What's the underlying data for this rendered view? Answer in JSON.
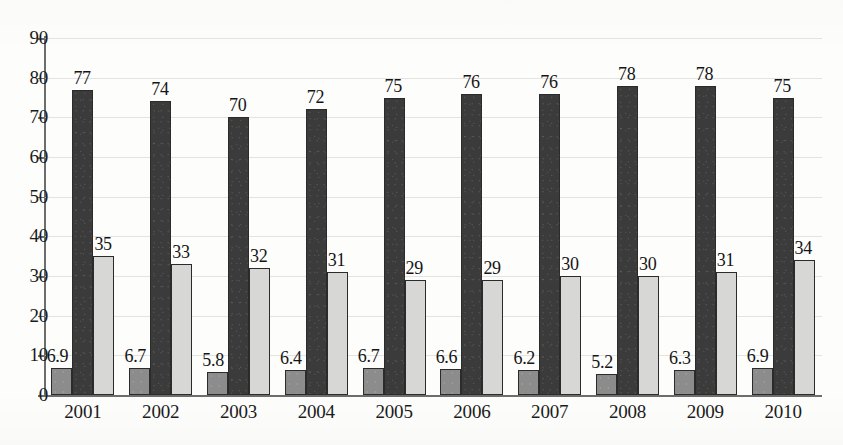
{
  "chart_data": {
    "type": "bar",
    "title": "",
    "subtitle": "",
    "xlabel": "",
    "ylabel": "",
    "ylim": [
      0,
      90
    ],
    "ytick_step": 10,
    "ytick_labels": [
      "90",
      "80",
      "70",
      "60",
      "50",
      "40",
      "30",
      "20",
      "10",
      "0"
    ],
    "grid": true,
    "legend": "none",
    "categories": [
      "2001",
      "2002",
      "2003",
      "2004",
      "2005",
      "2006",
      "2007",
      "2008",
      "2009",
      "2010"
    ],
    "series": [
      {
        "name": "series-1",
        "color": "#8c8c8c",
        "values": [
          6.9,
          6.7,
          5.8,
          6.4,
          6.7,
          6.6,
          6.2,
          5.2,
          6.3,
          6.9
        ],
        "labels": [
          "6.9",
          "6.7",
          "5.8",
          "6.4",
          "6.7",
          "6.6",
          "6.2",
          "5.2",
          "6.3",
          "6.9"
        ]
      },
      {
        "name": "series-2",
        "color": "#3b3b3b",
        "values": [
          77,
          74,
          70,
          72,
          75,
          76,
          76,
          78,
          78,
          75
        ],
        "labels": [
          "77",
          "74",
          "70",
          "72",
          "75",
          "76",
          "76",
          "78",
          "78",
          "75"
        ]
      },
      {
        "name": "series-3",
        "color": "#d7d7d5",
        "values": [
          35,
          33,
          32,
          31,
          29,
          29,
          30,
          30,
          31,
          34
        ],
        "labels": [
          "35",
          "33",
          "32",
          "31",
          "29",
          "29",
          "30",
          "30",
          "31",
          "34"
        ]
      }
    ]
  }
}
